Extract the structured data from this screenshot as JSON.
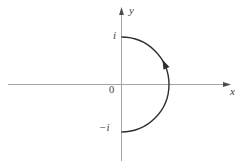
{
  "figure": {
    "labels": {
      "y_axis": "y",
      "x_axis": "x",
      "origin": "0",
      "top_point": "i",
      "bottom_point": "−i"
    },
    "colors": {
      "background": "#ffffff",
      "axis": "#9a9a9a",
      "axis_arrow": "#4a4a4a",
      "curve": "#2e2e2e",
      "label": "#3d3d3d"
    },
    "contour": {
      "shape": "right-half-circle",
      "from_point": "−i",
      "to_point": "i",
      "direction": "counterclockwise"
    }
  }
}
